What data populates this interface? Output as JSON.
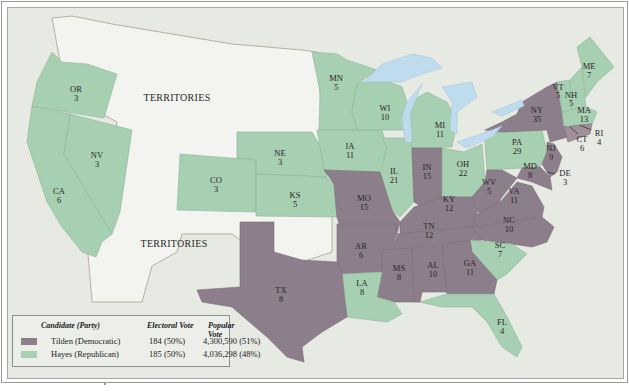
{
  "map": {
    "title": "Election of 1876",
    "colors": {
      "democratic": "#8d7e8c",
      "republican": "#a7cfb1",
      "territories": "#f3f4f0",
      "background": "#e7e9e3",
      "water": "#bfdcee",
      "border_line": "#c9b9a4"
    },
    "territory_labels": [
      "TERRITORIES",
      "TERRITORIES"
    ],
    "states": [
      {
        "abbr": "OR",
        "votes": "3",
        "party": "republican"
      },
      {
        "abbr": "CA",
        "votes": "6",
        "party": "republican"
      },
      {
        "abbr": "NV",
        "votes": "3",
        "party": "republican"
      },
      {
        "abbr": "CO",
        "votes": "3",
        "party": "republican"
      },
      {
        "abbr": "NE",
        "votes": "3",
        "party": "republican"
      },
      {
        "abbr": "KS",
        "votes": "5",
        "party": "republican"
      },
      {
        "abbr": "MN",
        "votes": "5",
        "party": "republican"
      },
      {
        "abbr": "IA",
        "votes": "11",
        "party": "republican"
      },
      {
        "abbr": "WI",
        "votes": "10",
        "party": "republican"
      },
      {
        "abbr": "MI",
        "votes": "11",
        "party": "republican"
      },
      {
        "abbr": "IL",
        "votes": "21",
        "party": "republican"
      },
      {
        "abbr": "OH",
        "votes": "22",
        "party": "republican"
      },
      {
        "abbr": "PA",
        "votes": "29",
        "party": "republican"
      },
      {
        "abbr": "VT",
        "votes": "5",
        "party": "republican"
      },
      {
        "abbr": "NH",
        "votes": "5",
        "party": "republican"
      },
      {
        "abbr": "ME",
        "votes": "7",
        "party": "republican"
      },
      {
        "abbr": "MA",
        "votes": "13",
        "party": "republican"
      },
      {
        "abbr": "RI",
        "votes": "4",
        "party": "republican"
      },
      {
        "abbr": "SC",
        "votes": "7",
        "party": "republican"
      },
      {
        "abbr": "LA",
        "votes": "8",
        "party": "republican"
      },
      {
        "abbr": "FL",
        "votes": "4",
        "party": "republican"
      },
      {
        "abbr": "MO",
        "votes": "15",
        "party": "democratic"
      },
      {
        "abbr": "IN",
        "votes": "15",
        "party": "democratic"
      },
      {
        "abbr": "KY",
        "votes": "12",
        "party": "democratic"
      },
      {
        "abbr": "WV",
        "votes": "5",
        "party": "democratic"
      },
      {
        "abbr": "VA",
        "votes": "11",
        "party": "democratic"
      },
      {
        "abbr": "MD",
        "votes": "8",
        "party": "democratic"
      },
      {
        "abbr": "DE",
        "votes": "3",
        "party": "democratic"
      },
      {
        "abbr": "NJ",
        "votes": "9",
        "party": "democratic"
      },
      {
        "abbr": "NY",
        "votes": "35",
        "party": "democratic"
      },
      {
        "abbr": "CT",
        "votes": "6",
        "party": "democratic"
      },
      {
        "abbr": "NC",
        "votes": "10",
        "party": "democratic"
      },
      {
        "abbr": "TN",
        "votes": "12",
        "party": "democratic"
      },
      {
        "abbr": "AR",
        "votes": "6",
        "party": "democratic"
      },
      {
        "abbr": "MS",
        "votes": "8",
        "party": "democratic"
      },
      {
        "abbr": "AL",
        "votes": "10",
        "party": "democratic"
      },
      {
        "abbr": "GA",
        "votes": "11",
        "party": "democratic"
      },
      {
        "abbr": "TX",
        "votes": "8",
        "party": "democratic"
      }
    ]
  },
  "legend": {
    "headers": {
      "candidate": "Candidate (Party)",
      "electoral": "Electoral Vote",
      "popular": "Popular Vote"
    },
    "rows": [
      {
        "name": "Tilden (Democratic)",
        "electoral": "184 (50%)",
        "popular": "4,300,590 (51%)",
        "color": "#8d7e8c"
      },
      {
        "name": "Hayes (Republican)",
        "electoral": "185 (50%)",
        "popular": "4,036,298 (48%)",
        "color": "#a7cfb1"
      }
    ]
  }
}
